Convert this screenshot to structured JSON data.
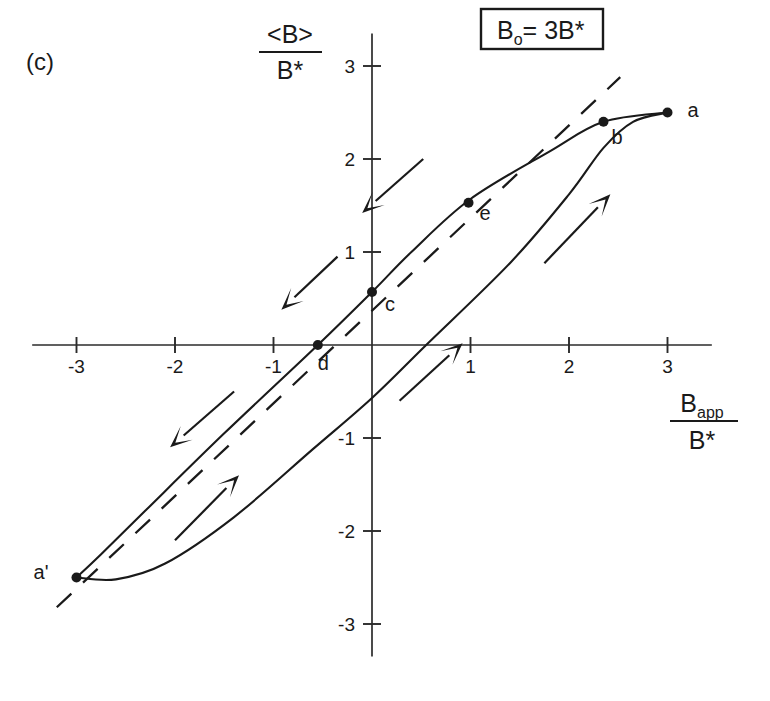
{
  "figure": {
    "panel_label": "(c)",
    "condition_box": {
      "symbol": "B",
      "subscript": "o",
      "equals": "= 3B*"
    },
    "y_axis_title": {
      "numerator": "<B>",
      "denominator": "B*"
    },
    "x_axis_title": {
      "numerator": "B",
      "numerator_sub": "app",
      "denominator": "B*"
    }
  },
  "chart_data": {
    "type": "line",
    "title": "",
    "subtitle": "",
    "xlabel": "B_app / B*",
    "ylabel": "<B> / B*",
    "annotation": "B_o = 3B*",
    "panel": "(c)",
    "xlim": [
      -3.45,
      3.45
    ],
    "ylim": [
      -3.35,
      3.35
    ],
    "xticks": [
      -3,
      -2,
      -1,
      1,
      2,
      3
    ],
    "yticks": [
      -3,
      -2,
      -1,
      1,
      2,
      3
    ],
    "xticklabels": [
      "-3",
      "-2",
      "-1",
      "1",
      "2",
      "3"
    ],
    "yticklabels": [
      "-3",
      "-2",
      "-1",
      "1",
      "2",
      "3"
    ],
    "grid": false,
    "legend": "none",
    "series": [
      {
        "name": "descending-branch",
        "direction": "decreasing",
        "style": "solid",
        "points": [
          [
            3.0,
            2.5
          ],
          [
            2.35,
            2.4
          ],
          [
            1.8,
            2.08
          ],
          [
            1.0,
            1.57
          ],
          [
            0.4,
            1.0
          ],
          [
            0.0,
            0.57
          ],
          [
            -0.55,
            0.0
          ],
          [
            -1.5,
            -0.95
          ],
          [
            -2.3,
            -1.78
          ],
          [
            -2.75,
            -2.25
          ],
          [
            -3.0,
            -2.5
          ]
        ]
      },
      {
        "name": "ascending-branch",
        "direction": "increasing",
        "style": "solid",
        "points": [
          [
            -3.0,
            -2.5
          ],
          [
            -2.6,
            -2.52
          ],
          [
            -2.1,
            -2.35
          ],
          [
            -1.4,
            -1.85
          ],
          [
            -0.6,
            -1.12
          ],
          [
            0.0,
            -0.57
          ],
          [
            0.55,
            0.0
          ],
          [
            1.4,
            0.88
          ],
          [
            2.0,
            1.62
          ],
          [
            2.35,
            2.12
          ],
          [
            2.65,
            2.4
          ],
          [
            3.0,
            2.5
          ]
        ]
      },
      {
        "name": "reference-dashed-line",
        "style": "dashed",
        "points": [
          [
            -3.2,
            -2.82
          ],
          [
            2.52,
            2.88
          ]
        ]
      }
    ],
    "labeled_points": [
      {
        "label": "a",
        "x": 3.0,
        "y": 2.5,
        "label_dx": 20,
        "label_dy": 4
      },
      {
        "label": "b",
        "x": 2.35,
        "y": 2.4,
        "label_dx": 8,
        "label_dy": 22
      },
      {
        "label": "e",
        "x": 0.98,
        "y": 1.53,
        "label_dx": 11,
        "label_dy": 17
      },
      {
        "label": "c",
        "x": 0.0,
        "y": 0.57,
        "label_dx": 13,
        "label_dy": 19
      },
      {
        "label": "d",
        "x": -0.55,
        "y": 0.0,
        "label_dx": 0,
        "label_dy": 25
      },
      {
        "label": "a'",
        "x": -3.0,
        "y": -2.5,
        "label_dx": -28,
        "label_dy": 1
      }
    ],
    "direction_arrows": [
      {
        "name": "upper-left-of-center",
        "x1": -0.35,
        "y1": 0.95,
        "x2": -0.92,
        "y2": 0.38,
        "points": "down-left"
      },
      {
        "name": "upper-mid-left",
        "x1": 0.52,
        "y1": 2.0,
        "x2": -0.1,
        "y2": 1.42,
        "points": "down-left"
      },
      {
        "name": "upper-far-left",
        "x1": -1.4,
        "y1": -0.5,
        "x2": -2.05,
        "y2": -1.1,
        "points": "down-left"
      },
      {
        "name": "lower-right-upper",
        "x1": 1.75,
        "y1": 0.88,
        "x2": 2.42,
        "y2": 1.62,
        "points": "up-right"
      },
      {
        "name": "lower-near-origin",
        "x1": 0.28,
        "y1": -0.6,
        "x2": 0.92,
        "y2": 0.02,
        "points": "up-right"
      },
      {
        "name": "lower-far-left",
        "x1": -2.0,
        "y1": -2.1,
        "x2": -1.35,
        "y2": -1.4,
        "points": "up-right"
      }
    ]
  }
}
